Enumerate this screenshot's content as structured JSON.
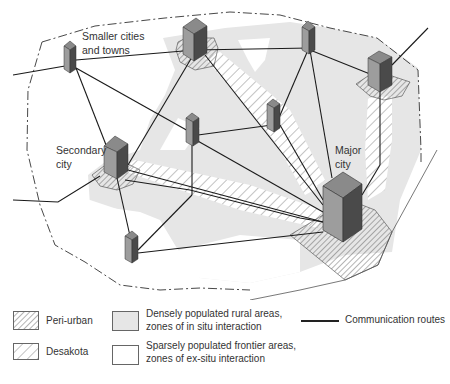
{
  "diagram": {
    "labels": {
      "smaller_cities_line1": "Smaller cities",
      "smaller_cities_line2": "and towns",
      "secondary_city_line1": "Secondary",
      "secondary_city_line2": "city",
      "major_city_line1": "Major",
      "major_city_line2": "city"
    },
    "nodes": [
      {
        "id": "A",
        "type": "smaller-town"
      },
      {
        "id": "B",
        "type": "secondary-city"
      },
      {
        "id": "C",
        "type": "smaller-town"
      },
      {
        "id": "D",
        "type": "secondary-city"
      },
      {
        "id": "E",
        "type": "smaller-town"
      },
      {
        "id": "F",
        "type": "smaller-town"
      },
      {
        "id": "G",
        "type": "secondary-city",
        "label": "Secondary city"
      },
      {
        "id": "H",
        "type": "smaller-town"
      },
      {
        "id": "I",
        "type": "major-city",
        "label": "Major city"
      }
    ],
    "colors": {
      "dense_rural": "#e6e6e6",
      "sparse_frontier": "#ffffff",
      "block_top": "#8a8a8a",
      "block_front": "#9d9d9d",
      "block_side": "#4a4a4a",
      "route": "#1a1a1a",
      "hatch": "#444444"
    }
  },
  "legend": {
    "peri_urban": "Peri-urban",
    "desakota": "Desakota",
    "dense_line1": "Densely populated rural areas,",
    "dense_line2": "zones of in situ interaction",
    "sparse_line1": "Sparsely populated frontier areas,",
    "sparse_line2": "zones of ex-situ interaction",
    "routes": "Communication routes"
  }
}
